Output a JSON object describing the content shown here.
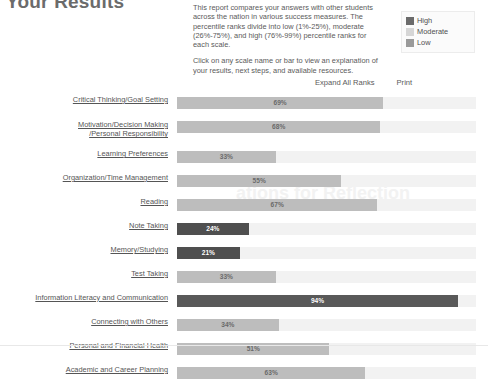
{
  "header": {
    "title": "Your Results",
    "intro_paragraph_1": "This report compares your answers with other students across the nation in various success measures. The percentile ranks divide into low (1%-25%), moderate (26%-75%), and high (76%-99%) percentile ranks for each scale.",
    "intro_paragraph_2": "Click on any scale name or bar to view an explanation of your results, next steps, and available resources."
  },
  "legend": {
    "items": [
      {
        "label": "High",
        "color": "#6b6b6b"
      },
      {
        "label": "Moderate",
        "color": "#d6d6d6"
      },
      {
        "label": "Low",
        "color": "#9a9a9a"
      }
    ]
  },
  "actions": {
    "expand_all": "Expand All Ranks",
    "print": "Print"
  },
  "watermark": "ations for Reflection",
  "chart_data": {
    "type": "bar",
    "title": "Your Results",
    "xlabel": "",
    "ylabel": "",
    "xlim": [
      0,
      100
    ],
    "grid": false,
    "orientation": "horizontal",
    "value_suffix": "%",
    "legend_position": "top-right",
    "categories": [
      "Critical Thinking/Goal Setting",
      "Motivation/Decision Making /Personal Responsibility",
      "Learning Preferences",
      "Organization/Time Management",
      "Reading",
      "Note Taking",
      "Memory/Studying",
      "Test Taking",
      "Information Literacy and Communication",
      "Connecting with Others",
      "Personal and Financial Health",
      "Academic and Career Planning"
    ],
    "values": [
      69,
      68,
      33,
      55,
      67,
      24,
      21,
      33,
      94,
      34,
      51,
      63
    ],
    "bands": [
      "moderate",
      "moderate",
      "moderate",
      "moderate",
      "moderate",
      "low",
      "low",
      "moderate",
      "high",
      "moderate",
      "moderate",
      "moderate"
    ]
  },
  "rows": [
    {
      "label": "Critical Thinking/Goal Setting",
      "value": 69,
      "display": "69%",
      "band": "moderate",
      "tall": false
    },
    {
      "label": "Motivation/Decision Making /Personal Responsibility",
      "label_line1": "Motivation/Decision Making",
      "label_line2": "/Personal Responsibility",
      "value": 68,
      "display": "68%",
      "band": "moderate",
      "tall": true
    },
    {
      "label": "Learning Preferences",
      "value": 33,
      "display": "33%",
      "band": "moderate",
      "tall": false
    },
    {
      "label": "Organization/Time Management",
      "value": 55,
      "display": "55%",
      "band": "moderate",
      "tall": false
    },
    {
      "label": "Reading",
      "value": 67,
      "display": "67%",
      "band": "moderate",
      "tall": false
    },
    {
      "label": "Note Taking",
      "value": 24,
      "display": "24%",
      "band": "low",
      "tall": false
    },
    {
      "label": "Memory/Studying",
      "value": 21,
      "display": "21%",
      "band": "low",
      "tall": false
    },
    {
      "label": "Test Taking",
      "value": 33,
      "display": "33%",
      "band": "moderate",
      "tall": false
    },
    {
      "label": "Information Literacy and Communication",
      "value": 94,
      "display": "94%",
      "band": "high",
      "tall": false
    },
    {
      "label": "Connecting with Others",
      "value": 34,
      "display": "34%",
      "band": "moderate",
      "tall": false
    },
    {
      "label": "Personal and Financial Health",
      "value": 51,
      "display": "51%",
      "band": "moderate",
      "tall": false
    },
    {
      "label": "Academic and Career Planning",
      "value": 63,
      "display": "63%",
      "band": "moderate",
      "tall": false
    }
  ]
}
